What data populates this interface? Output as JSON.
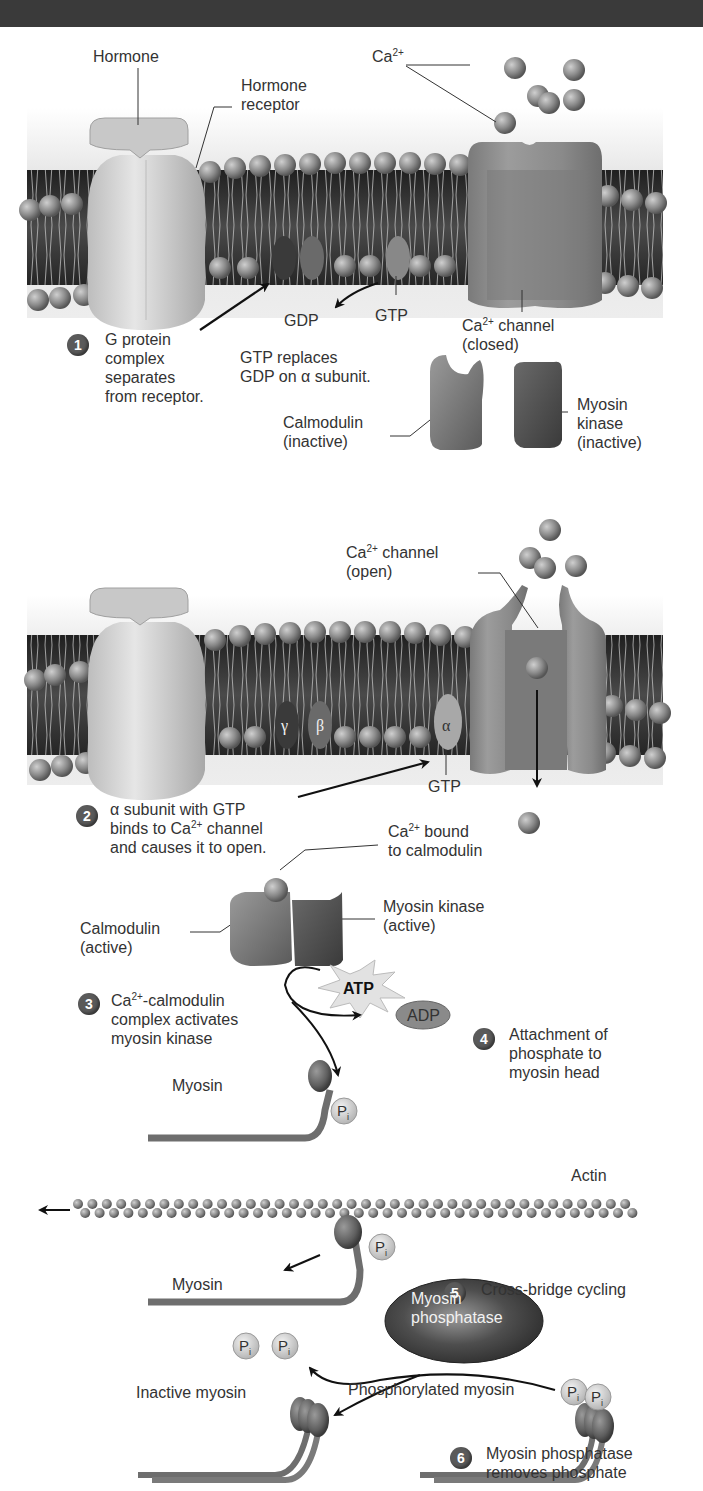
{
  "header": {
    "bar_color": "#3a3a3a"
  },
  "colors": {
    "background": "#ffffff",
    "membrane_dark": "#2e2e2e",
    "membrane_band": "#8a8a8a",
    "phospholipid_head": "#707070",
    "receptor": "#d0d0d0",
    "channel": "#8c8c8c",
    "calcium_ion": "#9a9a9a",
    "myosin_kinase": "#555555",
    "calmodulin": "#7a7a7a",
    "phosphatase": "#4a4a4a",
    "text": "#333333",
    "step_badge": "#5a5a5a"
  },
  "panel1": {
    "hormone_label": "Hormone",
    "hormone_receptor_label": "Hormone\nreceptor",
    "ca_label_base": "Ca",
    "ca_label_sup": "2+",
    "gdp_label": "GDP",
    "gtp_label": "GTP",
    "step1_number": "1",
    "step1_text": "G protein\ncomplex\nseparates\nfrom receptor.",
    "gtp_replaces_text": "GTP replaces\nGDP on α subunit.",
    "channel_label_base": "Ca",
    "channel_label_sup": "2+",
    "channel_label_rest": " channel",
    "channel_state": "(closed)",
    "calmodulin_label": "Calmodulin\n(inactive)",
    "myosin_kinase_label": "Myosin\nkinase\n(inactive)"
  },
  "panel2": {
    "channel_label_base": "Ca",
    "channel_label_sup": "2+",
    "channel_label_rest": " channel",
    "channel_state": "(open)",
    "gamma_symbol": "γ",
    "beta_symbol": "β",
    "alpha_symbol": "α",
    "gtp_label": "GTP",
    "step2_number": "2",
    "step2_line1": "α subunit with GTP",
    "step2_line2_base": "binds to Ca",
    "step2_line2_sup": "2+",
    "step2_line2_rest": " channel",
    "step2_line3": "and causes it to open."
  },
  "panel3": {
    "ca_bound_base": "Ca",
    "ca_bound_sup": "2+",
    "ca_bound_rest": " bound",
    "ca_bound_line2": "to calmodulin",
    "calmodulin_label": "Calmodulin\n(active)",
    "myosin_kinase_label": "Myosin kinase\n(active)",
    "atp_label": "ATP",
    "adp_label": "ADP",
    "step3_number": "3",
    "step3_line1_base": "Ca",
    "step3_line1_sup": "2+",
    "step3_line1_rest": "-calmodulin",
    "step3_rest": "complex activates\nmyosin kinase",
    "step4_number": "4",
    "step4_text": "Attachment of\nphosphate to\nmyosin head",
    "myosin_label": "Myosin",
    "pi_label": "P",
    "pi_sub": "i"
  },
  "panel4": {
    "actin_label": "Actin",
    "myosin_label": "Myosin",
    "pi_label": "P",
    "pi_sub": "i",
    "step5_number": "5",
    "step5_text": "Cross-bridge cycling"
  },
  "panel5": {
    "phosphatase_label": "Myosin\nphosphatase",
    "pi_label": "P",
    "pi_sub": "i",
    "inactive_myosin_label": "Inactive myosin",
    "phosphorylated_myosin_label": "Phosphorylated myosin",
    "step6_number": "6",
    "step6_text": "Myosin phosphatase\nremoves phosphate"
  }
}
